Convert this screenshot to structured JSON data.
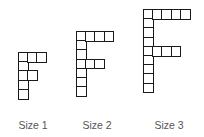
{
  "figures": [
    {
      "label": "Size 1",
      "origin": [
        18,
        52
      ],
      "cell": 10.8,
      "stem_height": 5,
      "arms": [
        {
          "row": 0,
          "length": 3
        },
        {
          "row": 2,
          "length": 2
        }
      ],
      "label_center_x": 33
    },
    {
      "label": "Size 2",
      "origin": [
        76,
        31
      ],
      "cell": 10.8,
      "stem_height": 7,
      "arms": [
        {
          "row": 0,
          "length": 4
        },
        {
          "row": 3,
          "length": 3
        }
      ],
      "label_center_x": 97
    },
    {
      "label": "Size 3",
      "origin": [
        143,
        9
      ],
      "cell": 10.8,
      "stem_height": 9,
      "arms": [
        {
          "row": 0,
          "length": 5
        },
        {
          "row": 4,
          "length": 4
        }
      ],
      "label_center_x": 169
    }
  ],
  "colors": {
    "line": "#1a1a1a",
    "label": "#555555",
    "background": "#ffffff"
  }
}
